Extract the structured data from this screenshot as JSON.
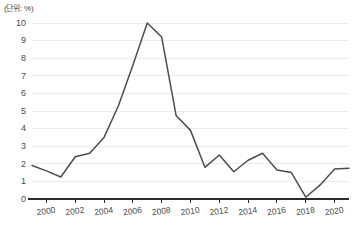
{
  "unit_label": "(단위: %)",
  "chart_data": {
    "type": "line",
    "title": "",
    "subtitle": "",
    "xlabel": "",
    "ylabel": "",
    "unit": "(단위: %)",
    "grid": true,
    "legend": "none",
    "xlim": [
      1999,
      2021
    ],
    "ylim": [
      0,
      10
    ],
    "x_tick_labels": [
      "2000",
      "2002",
      "2004",
      "2006",
      "2008",
      "2010",
      "2012",
      "2014",
      "2016",
      "2018",
      "2020"
    ],
    "x_tick_values": [
      2000,
      2002,
      2004,
      2006,
      2008,
      2010,
      2012,
      2014,
      2016,
      2018,
      2020
    ],
    "y_tick_labels": [
      "0",
      "1",
      "2",
      "3",
      "4",
      "5",
      "6",
      "7",
      "8",
      "9",
      "10"
    ],
    "y_tick_values": [
      0,
      1,
      2,
      3,
      4,
      5,
      6,
      7,
      8,
      9,
      10
    ],
    "x": [
      1999,
      2000,
      2001,
      2002,
      2003,
      2004,
      2005,
      2006,
      2007,
      2008,
      2009,
      2010,
      2011,
      2012,
      2013,
      2014,
      2015,
      2016,
      2017,
      2018,
      2019,
      2020,
      2021
    ],
    "values": [
      1.9,
      1.6,
      1.25,
      2.4,
      2.6,
      3.5,
      5.3,
      7.6,
      10.0,
      9.2,
      4.75,
      3.9,
      1.8,
      2.5,
      1.55,
      2.2,
      2.6,
      1.65,
      1.5,
      0.1,
      0.8,
      1.7,
      1.75
    ],
    "series": [
      {
        "name": "series-1",
        "color": "#4d4d4d",
        "values": [
          1.9,
          1.6,
          1.25,
          2.4,
          2.6,
          3.5,
          5.3,
          7.6,
          10.0,
          9.2,
          4.75,
          3.9,
          1.8,
          2.5,
          1.55,
          2.2,
          2.6,
          1.65,
          1.5,
          0.1,
          0.8,
          1.7,
          1.75
        ]
      }
    ],
    "colors": {
      "line": "#4d4d4d",
      "grid": "#eceaea",
      "axis": "#2b2b2b",
      "text": "#4a4a4a",
      "background": "#ffffff"
    }
  }
}
